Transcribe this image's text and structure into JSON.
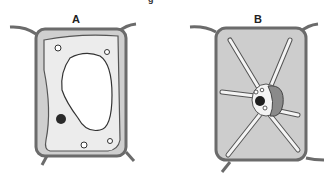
{
  "figure": {
    "top_caption_fragment": "g",
    "cells": [
      {
        "id": "A",
        "label": "A",
        "description": "plant cell with large central vacuole, nucleus at lower left, small vesicles"
      },
      {
        "id": "B",
        "label": "B",
        "description": "plant cell with cytoplasmic strands radiating from central nucleus region, vacuole shrunk"
      }
    ]
  },
  "colors": {
    "wall": "#6b6b6b",
    "cytoplasm": "#d4d4d4",
    "cytoplasm_light": "#e6e6e6",
    "vacuole": "#ffffff",
    "nucleus": "#2a2a2a",
    "organelle_B": "#8a8a8a"
  }
}
